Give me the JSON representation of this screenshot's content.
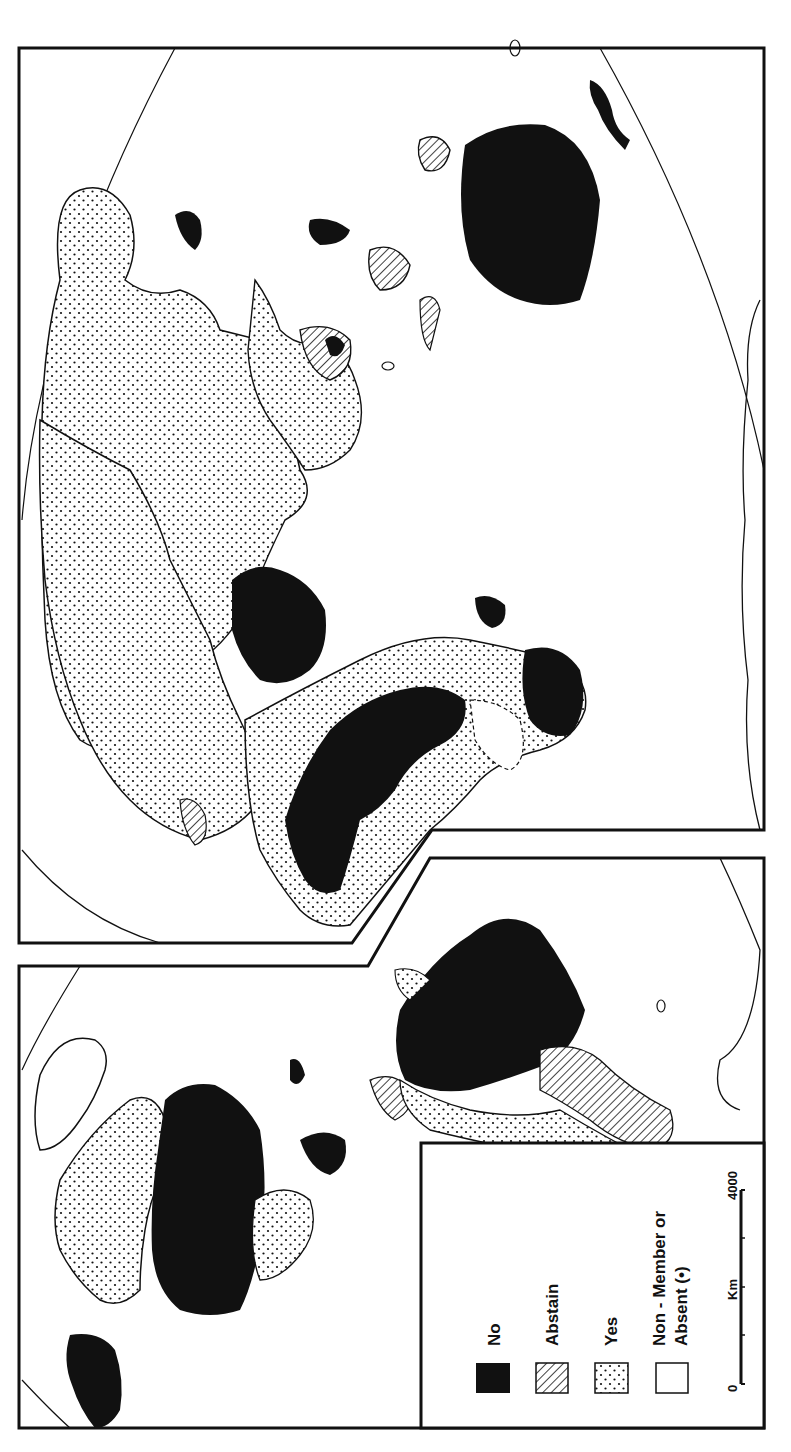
{
  "map": {
    "orientation": "rotated 90 degrees counter-clockwise (text reads bottom-to-top)",
    "panels": [
      {
        "id": "eastern-hemisphere",
        "label": "Europe, Africa, Asia, Australia"
      },
      {
        "id": "americas",
        "label": "North and South America"
      }
    ],
    "colors": {
      "no": "#111111",
      "abstain_hatch": "#111111",
      "yes_dots": "#111111",
      "background": "#ffffff",
      "outline": "#111111"
    }
  },
  "legend": {
    "items": [
      {
        "key": "no",
        "label": "No",
        "pattern": "solid-black"
      },
      {
        "key": "abstain",
        "label": "Abstain",
        "pattern": "diagonal-hatch"
      },
      {
        "key": "yes",
        "label": "Yes",
        "pattern": "dots"
      },
      {
        "key": "non_member",
        "label_line1": "Non - Member  or",
        "label_line2": "Absent  (•)",
        "pattern": "white"
      }
    ],
    "scale": {
      "start": "0",
      "unit": "Km",
      "end": "4000"
    }
  }
}
